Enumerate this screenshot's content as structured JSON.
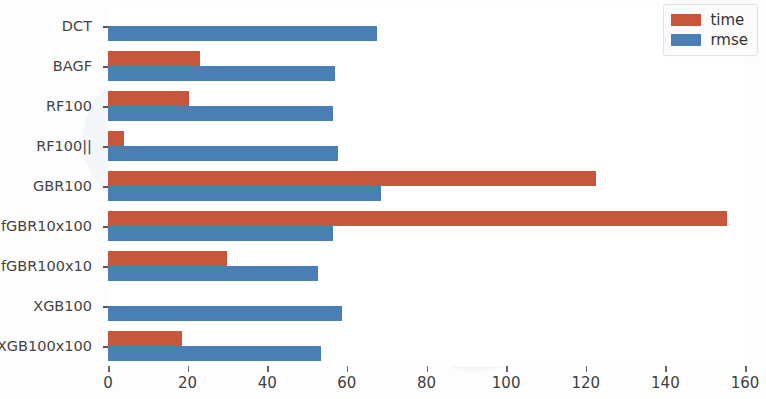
{
  "chart_data": {
    "type": "bar",
    "orientation": "horizontal",
    "title": "",
    "xlabel": "",
    "ylabel": "",
    "xlim": [
      0,
      160
    ],
    "xticks": [
      0,
      20,
      40,
      60,
      80,
      100,
      120,
      140,
      160
    ],
    "xtick_labels": [
      "0",
      "20",
      "40",
      "60",
      "80",
      "100",
      "120",
      "140",
      "160"
    ],
    "grid": false,
    "legend_position": "upper right",
    "categories": [
      "DCT",
      "BAGF",
      "RF100",
      "RF100||",
      "GBR100",
      "fGBR10x100",
      "fGBR100x10",
      "XGB100",
      "XGB100x100"
    ],
    "series": [
      {
        "name": "time",
        "color": "#c8563c",
        "values": [
          0,
          23,
          20.4,
          4,
          122.5,
          155.5,
          30,
          0,
          18.5
        ]
      },
      {
        "name": "rmse",
        "color": "#4a7fb5",
        "values": [
          67.6,
          57,
          56.5,
          57.8,
          68.5,
          56.5,
          52.8,
          58.8,
          53.4
        ]
      }
    ]
  },
  "legend": {
    "items": [
      {
        "label": "time",
        "color": "#c8563c"
      },
      {
        "label": "rmse",
        "color": "#4a7fb5"
      }
    ]
  }
}
